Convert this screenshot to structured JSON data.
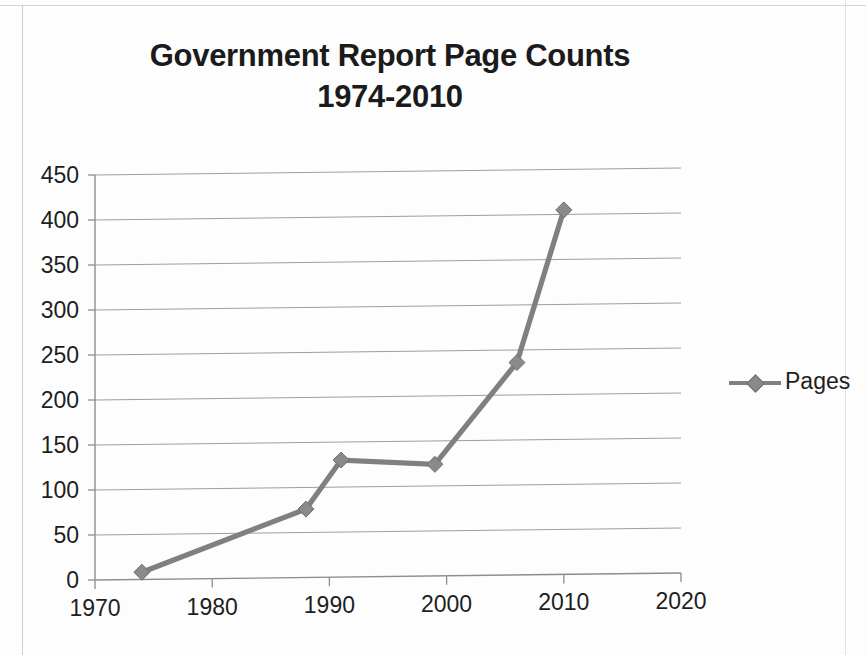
{
  "chart_data": {
    "type": "line",
    "title": "Government Report Page Counts",
    "subtitle": "1974-2010",
    "xlabel": "",
    "ylabel": "",
    "xlim": [
      1970,
      2020
    ],
    "ylim": [
      0,
      450
    ],
    "xticks": [
      1970,
      1980,
      1990,
      2000,
      2010,
      2020
    ],
    "yticks": [
      0,
      50,
      100,
      150,
      200,
      250,
      300,
      350,
      400,
      450
    ],
    "grid": "horizontal",
    "legend_position": "right",
    "series": [
      {
        "name": "Pages",
        "color": "#808080",
        "marker": "diamond",
        "x": [
          1974,
          1988,
          1991,
          1999,
          2006,
          2010
        ],
        "values": [
          8,
          76,
          130,
          124,
          236,
          405
        ],
        "points": [
          {
            "x": 1974,
            "y": 8
          },
          {
            "x": 1988,
            "y": 76
          },
          {
            "x": 1991,
            "y": 130
          },
          {
            "x": 1999,
            "y": 124
          },
          {
            "x": 2006,
            "y": 236
          },
          {
            "x": 2010,
            "y": 405
          }
        ]
      }
    ]
  },
  "title": {
    "line1": "Government Report Page Counts",
    "line2": "1974-2010"
  },
  "axis": {
    "y_labels": [
      "450",
      "400",
      "350",
      "300",
      "250",
      "200",
      "150",
      "100",
      "50",
      "0"
    ],
    "x_labels": [
      "1970",
      "1980",
      "1990",
      "2000",
      "2010",
      "2020"
    ]
  },
  "legend": {
    "items": [
      {
        "label": "Pages",
        "color": "#808080"
      }
    ]
  }
}
